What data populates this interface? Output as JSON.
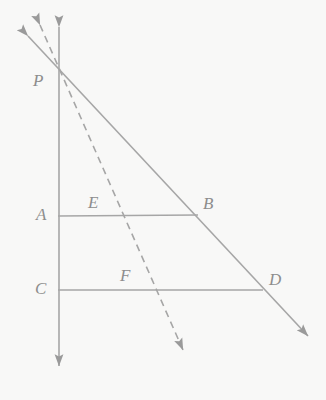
{
  "figure": {
    "background_color": "#f8f8f7",
    "line_color": "#a6a6a6",
    "label_color": "#8d8d8d",
    "width": 326,
    "height": 400
  },
  "points": {
    "P": {
      "label": "P",
      "x": 59,
      "y": 75,
      "label_x": 33,
      "label_y": 72
    },
    "A": {
      "label": "A",
      "x": 59,
      "y": 216,
      "label_x": 36,
      "label_y": 206
    },
    "E": {
      "label": "E",
      "x": 120,
      "y": 216,
      "label_x": 88,
      "label_y": 194
    },
    "B": {
      "label": "B",
      "x": 197,
      "y": 214,
      "label_x": 203,
      "label_y": 195
    },
    "C": {
      "label": "C",
      "x": 59,
      "y": 290,
      "label_x": 35,
      "label_y": 280
    },
    "F": {
      "label": "F",
      "x": 152,
      "y": 290,
      "label_x": 120,
      "label_y": 267
    },
    "D": {
      "label": "D",
      "x": 262,
      "y": 290,
      "label_x": 269,
      "label_y": 271
    }
  },
  "rays": {
    "vertical": {
      "name": "vertical-ray-through-P",
      "style": "solid",
      "top_tip_x": 59,
      "top_tip_y": 21,
      "bottom_tip_x": 59,
      "bottom_tip_y": 372
    },
    "solid_diagonal": {
      "name": "solid-diagonal-ray-PBD",
      "style": "solid",
      "top_tip_x": 23,
      "top_tip_y": 31,
      "bottom_tip_x": 313,
      "bottom_tip_y": 341
    },
    "dashed_diagonal": {
      "name": "dashed-diagonal-ray-PEF",
      "style": "dashed",
      "dash_pattern": "7 5",
      "top_tip_x": 37,
      "top_tip_y": 17,
      "bottom_tip_x": 186,
      "bottom_tip_y": 356
    }
  },
  "segments": {
    "AB": {
      "name": "segment-AB",
      "x1": 59,
      "y1": 216,
      "x2": 197,
      "y2": 215
    },
    "CD": {
      "name": "segment-CD",
      "x1": 59,
      "y1": 290,
      "x2": 262,
      "y2": 290
    }
  }
}
